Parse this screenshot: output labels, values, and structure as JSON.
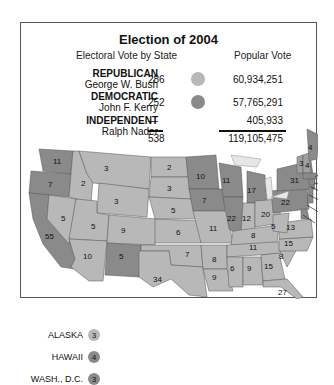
{
  "title": "Election of 2004",
  "headers": {
    "electoral": "Electoral Vote by State",
    "popular": "Popular Vote"
  },
  "colors": {
    "republican": "#b8b8b8",
    "democratic": "#8a8a8a",
    "border": "#555555",
    "lakes": "#e6e6e6"
  },
  "parties": [
    {
      "party": "REPUBLICAN",
      "candidate": "George W. Bush",
      "electoral": "286",
      "popular": "60,934,251",
      "color": "#b8b8b8"
    },
    {
      "party": "DEMOCRATIC",
      "candidate": "John F. Kerry",
      "electoral": "252",
      "popular": "57,765,291",
      "color": "#8a8a8a"
    },
    {
      "party": "INDEPENDENT",
      "candidate": "Ralph Nader",
      "electoral": "—",
      "popular": "405,933"
    }
  ],
  "totals": {
    "electoral": "538",
    "popular": "119,105,475"
  },
  "insets": [
    {
      "label": "ALASKA",
      "value": "3",
      "party": "republican"
    },
    {
      "label": "HAWAII",
      "value": "4",
      "party": "democratic"
    },
    {
      "label": "WASH., D.C.",
      "value": "3",
      "party": "democratic"
    }
  ],
  "states": [
    {
      "label": "11",
      "party": "democratic",
      "name": "WA"
    },
    {
      "label": "7",
      "party": "democratic",
      "name": "OR"
    },
    {
      "label": "55",
      "party": "democratic",
      "name": "CA"
    },
    {
      "label": "2",
      "party": "republican",
      "name": "ID"
    },
    {
      "label": "5",
      "party": "republican",
      "name": "NV"
    },
    {
      "label": "3",
      "party": "republican",
      "name": "MT"
    },
    {
      "label": "3",
      "party": "republican",
      "name": "WY"
    },
    {
      "label": "5",
      "party": "republican",
      "name": "UT"
    },
    {
      "label": "10",
      "party": "republican",
      "name": "AZ"
    },
    {
      "label": "9",
      "party": "republican",
      "name": "CO"
    },
    {
      "label": "5",
      "party": "republican",
      "name": "NM"
    },
    {
      "label": "2",
      "party": "republican",
      "name": "ND"
    },
    {
      "label": "3",
      "party": "republican",
      "name": "SD"
    },
    {
      "label": "5",
      "party": "republican",
      "name": "NE"
    },
    {
      "label": "6",
      "party": "republican",
      "name": "KS"
    },
    {
      "label": "7",
      "party": "republican",
      "name": "OK"
    },
    {
      "label": "34",
      "party": "republican",
      "name": "TX"
    },
    {
      "label": "10",
      "party": "democratic",
      "name": "MN"
    },
    {
      "label": "7",
      "party": "republican",
      "name": "IA"
    },
    {
      "label": "11",
      "party": "republican",
      "name": "MO"
    },
    {
      "label": "6",
      "party": "republican",
      "name": "AR"
    },
    {
      "label": "9",
      "party": "republican",
      "name": "LA"
    },
    {
      "label": "10",
      "party": "democratic",
      "name": "WI"
    },
    {
      "label": "21",
      "party": "democratic",
      "name": "IL"
    },
    {
      "label": "17",
      "party": "democratic",
      "name": "MI"
    },
    {
      "label": "11",
      "party": "republican",
      "name": "IN"
    },
    {
      "label": "20",
      "party": "republican",
      "name": "OH"
    },
    {
      "label": "8",
      "party": "republican",
      "name": "KY"
    },
    {
      "label": "11",
      "party": "republican",
      "name": "TN"
    },
    {
      "label": "6",
      "party": "republican",
      "name": "MS"
    },
    {
      "label": "9",
      "party": "republican",
      "name": "AL"
    },
    {
      "label": "15",
      "party": "republican",
      "name": "GA"
    },
    {
      "label": "27",
      "party": "republican",
      "name": "FL"
    },
    {
      "label": "8",
      "party": "republican",
      "name": "SC"
    },
    {
      "label": "15",
      "party": "republican",
      "name": "NC"
    },
    {
      "label": "13",
      "party": "republican",
      "name": "VA"
    },
    {
      "label": "5",
      "party": "republican",
      "name": "WV"
    },
    {
      "label": "21",
      "party": "democratic",
      "name": "PA"
    },
    {
      "label": "31",
      "party": "democratic",
      "name": "NY"
    },
    {
      "label": "3",
      "party": "democratic",
      "name": "VT"
    },
    {
      "label": "4",
      "party": "democratic",
      "name": "NH"
    },
    {
      "label": "4",
      "party": "democratic",
      "name": "ME"
    },
    {
      "label": "12",
      "party": "democratic",
      "name": "MA"
    },
    {
      "label": "4",
      "party": "democratic",
      "name": "RI"
    },
    {
      "label": "7",
      "party": "democratic",
      "name": "CT"
    },
    {
      "label": "15",
      "party": "democratic",
      "name": "NJ"
    },
    {
      "label": "3",
      "party": "democratic",
      "name": "DE"
    },
    {
      "label": "10",
      "party": "democratic",
      "name": "MD"
    }
  ]
}
